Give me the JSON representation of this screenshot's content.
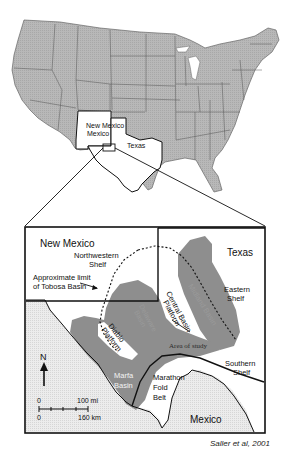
{
  "overview_map": {
    "region": "Contiguous United States",
    "state_labels": [
      "New Mexico",
      "Texas"
    ],
    "highlighted_states": [
      "New Mexico",
      "Texas"
    ]
  },
  "detail_map": {
    "state_labels": {
      "new_mexico": "New Mexico",
      "texas": "Texas",
      "mexico": "Mexico"
    },
    "features": {
      "northwestern_shelf": [
        "Northwestern",
        "Shelf"
      ],
      "tobosa_limit": [
        "Approximate limit",
        "of Tobosa Basin"
      ],
      "central_basin_platform": [
        "Central Basin",
        "Platform"
      ],
      "midland_basin": "Midland Basin",
      "eastern_shelf": [
        "Eastern",
        "Shelf"
      ],
      "delaware_basin": [
        "Delaware",
        "Basin"
      ],
      "diablo_platform": [
        "Diablo",
        "Platform"
      ],
      "area_of_study": "Area of study",
      "southern_shelf": [
        "Southern",
        "Shelf"
      ],
      "marfa_basin": [
        "Marfa",
        "Basin"
      ],
      "marathon_fold_belt": [
        "Marathon",
        "Fold",
        "Belt"
      ]
    },
    "north_arrow": "N",
    "scale": {
      "miles_zero": "0",
      "miles_label": "100 mi",
      "km_zero": "0",
      "km_label": "160 km"
    }
  },
  "credit": "Saller et al, 2001",
  "colors": {
    "land_gray": "#b4b4b4",
    "basin_gray": "#8c8c8c",
    "mexico_fill": "#e6e6e6",
    "line": "#111111"
  }
}
